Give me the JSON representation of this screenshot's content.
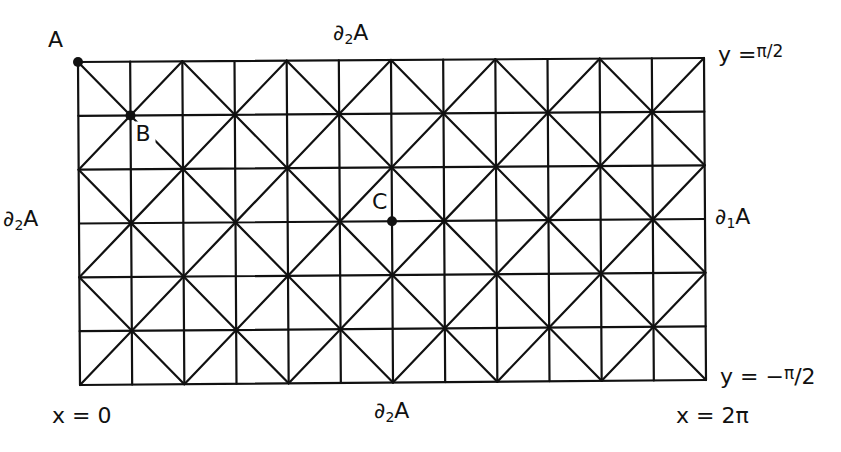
{
  "figure": {
    "type": "triangulated-rectangle-grid",
    "columns": 12,
    "rows": 6,
    "corners": {
      "top_left": [
        78,
        62
      ],
      "top_right": [
        704,
        58
      ],
      "bottom_left": [
        80,
        385
      ],
      "bottom_right": [
        706,
        380
      ]
    },
    "diagonal_rule": "connect grid vertices (i, j) with i + j even along slopes +1 and -1",
    "line_color": "#111111"
  },
  "points": [
    {
      "name": "A",
      "label": "A",
      "col": 0,
      "row": 0,
      "label_offset": [
        -30,
        -33
      ]
    },
    {
      "name": "B",
      "label": "B",
      "col": 1,
      "row": 1,
      "label_offset": [
        5,
        8
      ]
    },
    {
      "name": "C",
      "label": "C",
      "col": 6,
      "row": 3,
      "label_offset": [
        -20,
        -30
      ]
    }
  ],
  "labels": {
    "top_boundary": "∂₂A",
    "top_boundary_main": "∂",
    "top_boundary_sub": "2",
    "top_boundary_tail": "A",
    "bottom_boundary_main": "∂",
    "bottom_boundary_sub": "2",
    "bottom_boundary_tail": "A",
    "left_boundary_main": "∂",
    "left_boundary_sub": "2",
    "left_boundary_tail": "A",
    "right_boundary_main": "∂",
    "right_boundary_sub": "1",
    "right_boundary_tail": "A",
    "top_line_prefix": "y =",
    "top_line_value": "π/2",
    "bottom_line_prefix": "y = −",
    "bottom_line_pi": "π",
    "bottom_line_rest": "/2",
    "left_x": "x = 0",
    "right_x": "x = 2π"
  }
}
